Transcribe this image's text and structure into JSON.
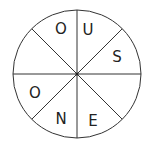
{
  "diagram": {
    "type": "letter-wheel",
    "segments_count": 8,
    "center": [
      77,
      74
    ],
    "radius": 64,
    "stroke_color": "#333333",
    "segments": [
      {
        "position": "top-right",
        "letter": "U"
      },
      {
        "position": "right-upper",
        "letter": "S"
      },
      {
        "position": "right-lower",
        "letter": ""
      },
      {
        "position": "bottom-right",
        "letter": "E"
      },
      {
        "position": "bottom-left",
        "letter": "N"
      },
      {
        "position": "left-lower",
        "letter": "O"
      },
      {
        "position": "left-upper",
        "letter": ""
      },
      {
        "position": "top-left",
        "letter": "O"
      }
    ]
  }
}
